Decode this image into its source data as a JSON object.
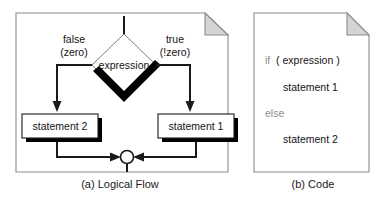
{
  "figure": {
    "panel_a": {
      "caption": "(a) Logical Flow",
      "decision": {
        "label": "expression",
        "shape": "diamond"
      },
      "branches": [
        {
          "side": "left",
          "label_line1": "false",
          "label_line2": "(zero)",
          "target": "statement 2"
        },
        {
          "side": "right",
          "label_line1": "true",
          "label_line2": "(!zero)",
          "target": "statement 1"
        }
      ],
      "boxes": [
        {
          "label": "statement 2"
        },
        {
          "label": "statement 1"
        }
      ],
      "merge_node": "merge-circle"
    },
    "panel_b": {
      "caption": "(b) Code",
      "code_lines": [
        {
          "keyword": "if",
          "rest": "  ( expression )",
          "indent": 0
        },
        {
          "keyword": "",
          "rest": "statement 1",
          "indent": 1
        },
        {
          "keyword": "else",
          "rest": "",
          "indent": 0
        },
        {
          "keyword": "",
          "rest": "statement 2",
          "indent": 1
        }
      ]
    },
    "colors": {
      "panel_border": "#8c8c8c",
      "fold_fill": "#d4d4d4",
      "line": "#1a1a1a",
      "shadow": "#000000",
      "keyword": "#8d8d8d",
      "text": "#141414",
      "diamond_outline": "#7a7a7a",
      "background": "#ffffff"
    }
  }
}
